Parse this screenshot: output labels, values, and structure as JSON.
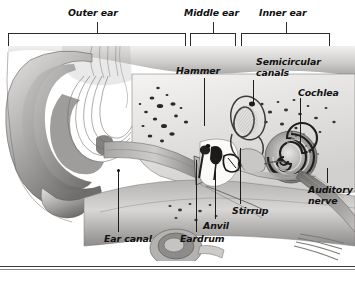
{
  "figure": {
    "type": "labeled anatomical cross-section diagram",
    "width": 355,
    "height": 282,
    "style": "grayscale medical illustration",
    "colors": {
      "background": "#ffffff",
      "label_text": "#111111",
      "leader_line": "#1d1d1d",
      "bracket": "#2b2b2b",
      "tissue_light": "#d8d6d4",
      "tissue_mid": "#9c9a98",
      "tissue_dark": "#5a5856",
      "bone_dark": "#2e2c2a",
      "cavity_white": "#f6f5f4"
    }
  },
  "region_brackets": [
    {
      "id": "outer-ear",
      "label": "Outer ear",
      "left": 8,
      "right": 186,
      "tick_x": 97,
      "label_x": 68,
      "label_y": 8
    },
    {
      "id": "middle-ear",
      "label": "Middle ear",
      "left": 190,
      "right": 236,
      "tick_x": 213,
      "label_x": 184,
      "label_y": 8
    },
    {
      "id": "inner-ear",
      "label": "Inner ear",
      "left": 241,
      "right": 330,
      "tick_x": 286,
      "label_x": 259,
      "label_y": 8
    }
  ],
  "callouts": [
    {
      "id": "hammer",
      "label": "Hammer",
      "label_x": 176,
      "label_y": 66,
      "leader": {
        "x": 204,
        "y_top": 78,
        "y_bottom": 126
      },
      "anchor": "malleus"
    },
    {
      "id": "semicircular-canals",
      "label_line1": "Semicircular",
      "label_line2": "canals",
      "label_x": 256,
      "label_y": 57,
      "leader": {
        "x": 253,
        "y_top": 80,
        "y_bottom": 103
      },
      "anchor": "semicircular canals"
    },
    {
      "id": "cochlea",
      "label": "Cochlea",
      "label_x": 298,
      "label_y": 88,
      "leader": {
        "x": 300,
        "y_top": 98,
        "y_bottom": 143
      },
      "anchor": "cochlea"
    },
    {
      "id": "auditory-nerve",
      "label_line1": "Auditory",
      "label_line2": "nerve",
      "label_x": 310,
      "label_y": 185,
      "leader": {
        "x": 327,
        "y_top": 168,
        "y_bottom": 183
      },
      "anchor": "auditory nerve"
    },
    {
      "id": "ear-canal",
      "label": "Ear canal",
      "label_x": 104,
      "label_y": 234,
      "leader": {
        "x": 118,
        "y_top": 170,
        "y_bottom": 232
      },
      "dot": {
        "x": 118,
        "y": 170
      },
      "anchor": "ear canal"
    },
    {
      "id": "eardrum",
      "label": "Eardrum",
      "label_x": 180,
      "label_y": 234,
      "leader": {
        "x": 196,
        "y_top": 160,
        "y_bottom": 232
      },
      "anchor": "tympanic membrane"
    },
    {
      "id": "anvil",
      "label": "Anvil",
      "label_x": 203,
      "label_y": 221,
      "leader": {
        "x": 215,
        "y_top": 152,
        "y_bottom": 219
      },
      "anchor": "incus"
    },
    {
      "id": "stirrup",
      "label": "Stirrup",
      "label_x": 232,
      "label_y": 206,
      "leader": {
        "x": 240,
        "y_top": 148,
        "y_bottom": 204
      },
      "anchor": "stapes"
    }
  ],
  "baseline_rules": [
    {
      "id": "rule-upper",
      "y": 266
    },
    {
      "id": "rule-lower",
      "y": 269
    }
  ]
}
